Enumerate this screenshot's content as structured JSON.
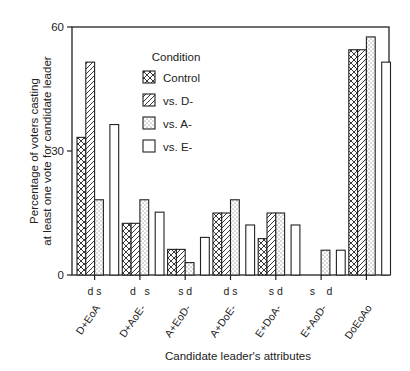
{
  "chart_data": {
    "type": "bar",
    "title": "",
    "xlabel": "Candidate leader's attributes",
    "ylabel_line1": "Percentage of voters casting",
    "ylabel_line2": "at least one vote for candidate leader",
    "ylim": [
      0,
      60
    ],
    "yticks": [
      0,
      30,
      60
    ],
    "grid": false,
    "legend_position": "upper center (inside plot)",
    "legend_title": "Condition",
    "categories": [
      "D+EoA",
      "D+AoE-",
      "A+EoD-",
      "A+DoE-",
      "E+DoA-",
      "E+AoD-",
      "DoEoAo"
    ],
    "tick_annotations": [
      "d s",
      "d   s",
      "s d",
      "d s",
      "s d",
      "s    d",
      ""
    ],
    "series": [
      {
        "name": "Control",
        "pattern": "crosshatch",
        "values": [
          33.3,
          12.5,
          6.2,
          15.0,
          8.8,
          0,
          54.5
        ]
      },
      {
        "name": "vs. D-",
        "pattern": "diagonal",
        "values": [
          51.5,
          12.5,
          6.2,
          15.0,
          15.0,
          0,
          54.5
        ]
      },
      {
        "name": "vs. A-",
        "pattern": "dots",
        "values": [
          18.2,
          18.2,
          3.0,
          18.2,
          15.0,
          6.0,
          57.6
        ]
      },
      {
        "name": "vs. E-",
        "pattern": "empty",
        "values": [
          36.4,
          15.2,
          9.1,
          12.1,
          12.1,
          6.0,
          51.5
        ]
      }
    ]
  }
}
